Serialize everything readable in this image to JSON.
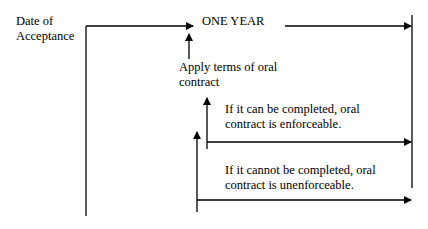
{
  "diagram": {
    "start_label": {
      "line1": "Date of",
      "line2": "Acceptance"
    },
    "period_label": "ONE YEAR",
    "apply_label": {
      "line1": "Apply terms of oral",
      "line2": "contract"
    },
    "completable_label": {
      "line1": "If it can be completed, oral",
      "line2": "contract is enforceable."
    },
    "not_completable_label": {
      "line1": "If it cannot be completed, oral",
      "line2": "contract is unenforceable."
    },
    "colors": {
      "line": "#000000",
      "background": "#ffffff",
      "text": "#000000"
    }
  }
}
